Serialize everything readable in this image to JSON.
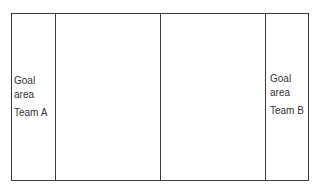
{
  "diagram": {
    "type": "playing-court-layout",
    "zones": [
      {
        "id": "goal-area-a",
        "label_lines": [
          "Goal",
          "area"
        ],
        "team": "Team A"
      },
      {
        "id": "left-half",
        "label_lines": [],
        "team": ""
      },
      {
        "id": "right-half",
        "label_lines": [],
        "team": ""
      },
      {
        "id": "goal-area-b",
        "label_lines": [
          "Goal",
          "area"
        ],
        "team": "Team B"
      }
    ],
    "line_color": "#3a3a3a",
    "text_color": "#333333"
  }
}
